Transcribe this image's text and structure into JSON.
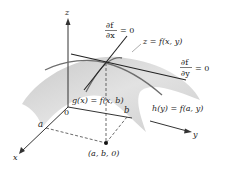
{
  "diagram": {
    "axes": {
      "z": "z",
      "y": "y",
      "x": "x",
      "origin": "0"
    },
    "tick_labels": {
      "a": "a",
      "b": "b"
    },
    "point_label": "(a, b, 0)",
    "labels": {
      "df_dx_num": "∂f",
      "df_dx_den": "∂x",
      "df_dx_eq": "= 0",
      "df_dy_num": "∂f",
      "df_dy_den": "∂y",
      "df_dy_eq": "= 0",
      "surface": "z = f(x, y)",
      "g_curve": "g(x) = f(x, b)",
      "h_curve": "h(y) = f(a, y)"
    },
    "colors": {
      "surface_fill": "#d4d4d4",
      "surface_edge": "#b8b8b8",
      "curve": "#6e6e6e",
      "tangent": "#222222",
      "axis": "#333333",
      "dashed": "#444444"
    }
  }
}
